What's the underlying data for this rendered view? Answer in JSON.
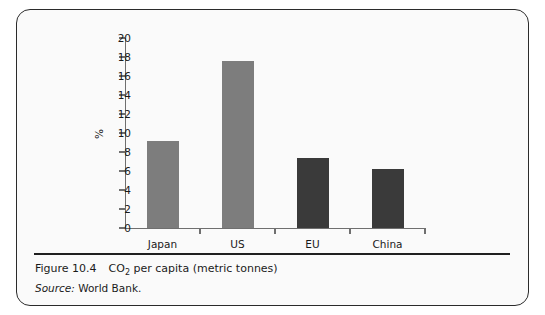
{
  "figure": {
    "caption_number": "Figure 10.4",
    "caption_title_before": "CO",
    "caption_title_sub": "2",
    "caption_title_after": " per capita (metric tonnes)",
    "source_label": "Source:",
    "source_value": " World Bank."
  },
  "colors": {
    "bar_light": "#7d7d7d",
    "bar_dark": "#3a3a3a",
    "axis": "#6f6f6f",
    "frame_border": "#2b2b2b",
    "panel_background": "#fafafa",
    "rule": "#1f1f1f"
  },
  "chart_data": {
    "type": "bar",
    "title": "",
    "xlabel": "",
    "ylabel": "%",
    "ylim": [
      0,
      20
    ],
    "ytick_step": 2,
    "yticks": [
      "20",
      "18",
      "16",
      "14",
      "12",
      "10",
      "8",
      "6",
      "4",
      "2",
      "0"
    ],
    "grid": false,
    "legend": false,
    "categories": [
      "Japan",
      "US",
      "EU",
      "China"
    ],
    "values": [
      9.2,
      17.6,
      7.4,
      6.2
    ],
    "bar_colors": [
      "#7d7d7d",
      "#7d7d7d",
      "#3a3a3a",
      "#3a3a3a"
    ]
  }
}
